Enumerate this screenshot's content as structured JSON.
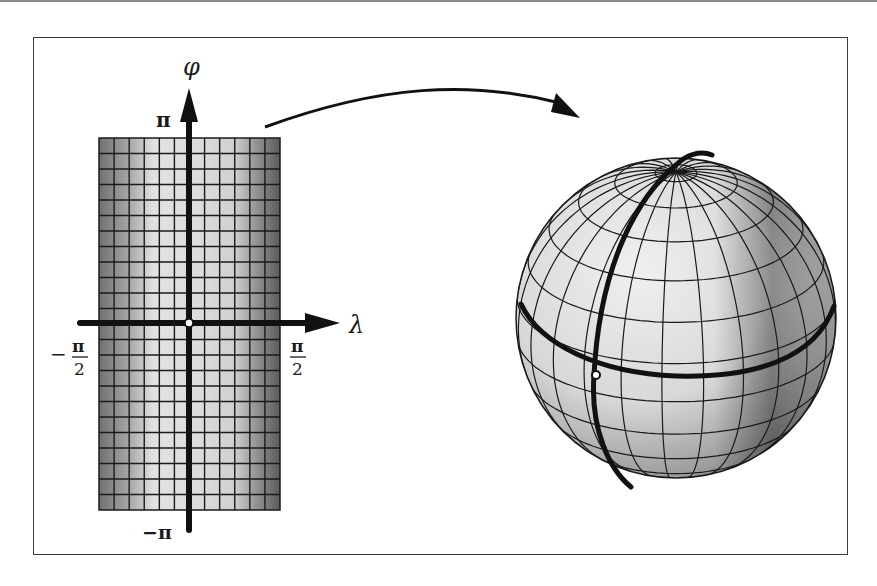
{
  "figure": {
    "left_panel": {
      "vertical_axis_label": "φ",
      "horizontal_axis_label": "λ",
      "top_tick": "π",
      "bottom_tick": "−π",
      "left_tick_num": "π",
      "left_tick_den": "2",
      "left_tick_sign": "−",
      "right_tick_num": "π",
      "right_tick_den": "2",
      "grid_columns": 12,
      "grid_rows": 24
    },
    "right_panel": {
      "object": "sphere",
      "highlighted_lines": [
        "equator",
        "meridian"
      ],
      "marked_point": "origin"
    },
    "arrow": "mapping-arrow",
    "colors": {
      "line": "#1a1a1a",
      "shade_dark": "#6b6b6b",
      "shade_light": "#e6e6e6",
      "frame": "#3a3a3a"
    }
  }
}
